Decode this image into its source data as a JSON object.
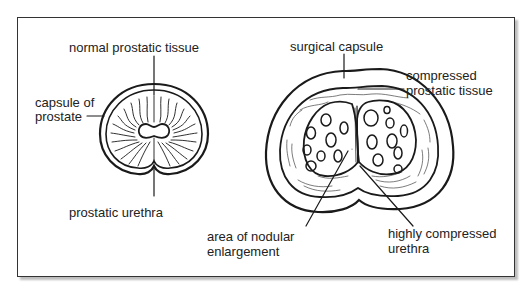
{
  "figure": {
    "left_diagram": {
      "name": "normal prostate",
      "labels": {
        "normal_tissue": "normal prostatic tissue",
        "capsule_line1": "capsule of",
        "capsule_line2": "prostate",
        "urethra": "prostatic urethra"
      }
    },
    "right_diagram": {
      "name": "enlarged prostate",
      "labels": {
        "surgical_capsule": "surgical capsule",
        "compressed_line1": "compressed",
        "compressed_line2": "prostatic tissue",
        "nodular_line1": "area of nodular",
        "nodular_line2": "enlargement",
        "urethra_line1": "highly compressed",
        "urethra_line2": "urethra"
      }
    },
    "colors": {
      "stroke": "#1a1a1a",
      "text": "#222222",
      "frame_shadow": "#bdbdbd"
    }
  }
}
